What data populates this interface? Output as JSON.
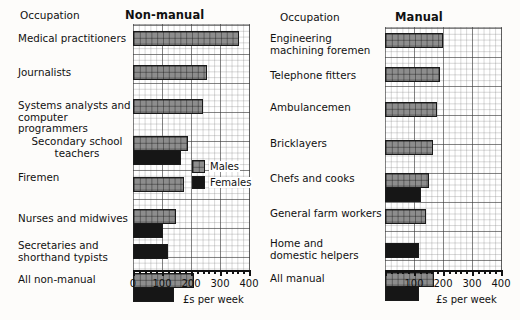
{
  "figure": {
    "axis_caption": "£s per week",
    "occupation_header": "Occupation",
    "legend": {
      "males_label": "Males",
      "females_label": "Females",
      "males_color": "#8d8d8d",
      "females_color": "#161616"
    },
    "axis_ticks_left": [
      "0",
      "100",
      "200",
      "300",
      "400"
    ],
    "axis_ticks_right": [
      "100",
      "200",
      "300",
      "400"
    ]
  },
  "chart_data": [
    {
      "type": "bar",
      "orientation": "horizontal",
      "title": "Non-manual",
      "xlabel": "£s per week",
      "ylabel": "Occupation",
      "xlim": [
        0,
        400
      ],
      "xticks": [
        0,
        100,
        200,
        300,
        400
      ],
      "grid": true,
      "legend_position": "inside-right",
      "categories": [
        "Medical practitioners",
        "Journalists",
        "Systems analysts and\ncomputer programmers",
        "Secondary school\nteachers",
        "Firemen",
        "Nurses and midwives",
        "Secretaries and\nshorthand typists",
        "All non-manual"
      ],
      "series": [
        {
          "name": "Males",
          "values": [
            365,
            255,
            240,
            190,
            175,
            148,
            null,
            212
          ]
        },
        {
          "name": "Females",
          "values": [
            null,
            null,
            null,
            165,
            null,
            105,
            120,
            140
          ]
        }
      ]
    },
    {
      "type": "bar",
      "orientation": "horizontal",
      "title": "Manual",
      "xlabel": "£s per week",
      "ylabel": "Occupation",
      "xlim": [
        0,
        400
      ],
      "xticks": [
        100,
        200,
        300,
        400
      ],
      "grid": true,
      "legend_position": "none",
      "categories": [
        "Engineering\nmachining foremen",
        "Telephone fitters",
        "Ambulancemen",
        "Bricklayers",
        "Chefs and cooks",
        "General farm workers",
        "Home and\ndomestic helpers",
        "All manual"
      ],
      "series": [
        {
          "name": "Males",
          "values": [
            200,
            190,
            178,
            165,
            150,
            142,
            null,
            170
          ]
        },
        {
          "name": "Females",
          "values": [
            null,
            null,
            null,
            null,
            125,
            null,
            118,
            118
          ]
        }
      ]
    }
  ]
}
